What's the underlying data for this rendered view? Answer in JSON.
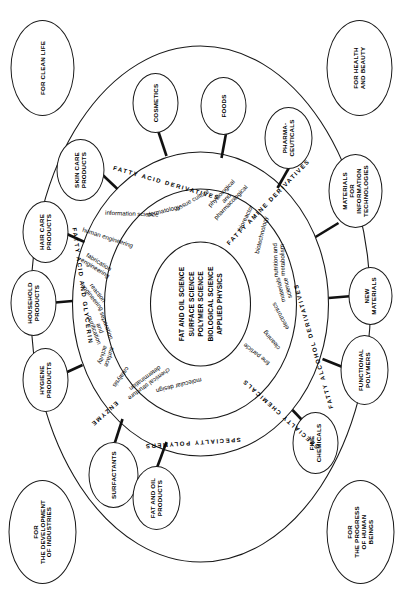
{
  "diagram": {
    "core": {
      "label": "core-sciences",
      "lines": [
        "FAT AND OIL SCIENCE",
        "SURFACE SCIENCE",
        "POLYMER SCIENCE",
        "BIOLOGICAL SCIENCE",
        "APPLIED PHYSICS"
      ],
      "text": "FAT AND OIL SCIENCE\nSURFACE SCIENCE\nPOLYMER SCIENCE\nBIOLOGICAL SCIENCE\nAPPLIED PHYSICS"
    },
    "middle_ring": {
      "label": "technology-fields",
      "items": [
        "fine particle",
        "cleaning",
        "electronics",
        "materials\nscience",
        "nutrition and\nmetabolism",
        "biotechnology",
        "bioreactor",
        "physiological\nand\npharmacological",
        "tissue culture",
        "dermatology",
        "information science",
        "human engineering",
        "fabrication\nengineering",
        "reaction\nengineering",
        "separation\nand\npurification",
        "surface\nactivity",
        "catalysis",
        "chemical structure\ndetermination",
        "molecular design"
      ]
    },
    "outer_ring": {
      "label": "material-classes",
      "items": [
        "FATTY ALCOHOL DERIVATIVES",
        "FATTY AMINE DERIVATIVES",
        "FATTY ACID DERIVATIVES",
        "FATTY ACID AND GLYCERIN",
        "ENZYME",
        "SPECIALTY POLYMERS",
        "SPECIALTY CHEMICALS"
      ]
    },
    "satellites": [
      {
        "id": "fine-chemicals",
        "text": "FINE\nCHEMICALS"
      },
      {
        "id": "functional-polymers",
        "text": "FUNCTIONAL\nPOLYMERS"
      },
      {
        "id": "new-materials",
        "text": "NEW\nMATERIALS"
      },
      {
        "id": "materials-for-it",
        "text": "MATERIALS\nFOR\nINFORMATION\nTECHNOLOGIES"
      },
      {
        "id": "pharmaceuticals",
        "text": "PHARMA-\nCEUTICALS"
      },
      {
        "id": "foods",
        "text": "FOODS"
      },
      {
        "id": "cosmetics",
        "text": "COSMETICS"
      },
      {
        "id": "skin-care-products",
        "text": "SKIN CARE\nPRODUCTS"
      },
      {
        "id": "hair-care-products",
        "text": "HAIR CARE\nPRODUCTS"
      },
      {
        "id": "household-products",
        "text": "HOUSEHOLD\nPRODUCTS"
      },
      {
        "id": "hygiene-products",
        "text": "HYGIENE\nPRODUCTS"
      },
      {
        "id": "surfactants",
        "text": "SURFACTANTS"
      },
      {
        "id": "fat-and-oil-products",
        "text": "FAT AND OIL\nPRODUCTS"
      }
    ],
    "corners": [
      {
        "id": "development-of-industries",
        "text": "FOR\nTHE DEVELOPMENT\nOF INDUSTRIES"
      },
      {
        "id": "progress-of-human-beings",
        "text": "FOR\nTHE PROGRESS\nOF HUMAN\nBEINGS"
      },
      {
        "id": "clean-life",
        "text": "FOR CLEAN LIFE"
      },
      {
        "id": "health-and-beauty",
        "text": "FOR HEALTH\nAND BEAUTY"
      }
    ],
    "colors": {
      "stroke": "#1a1a1a",
      "fill": "#ffffff",
      "text": "#000000"
    }
  }
}
